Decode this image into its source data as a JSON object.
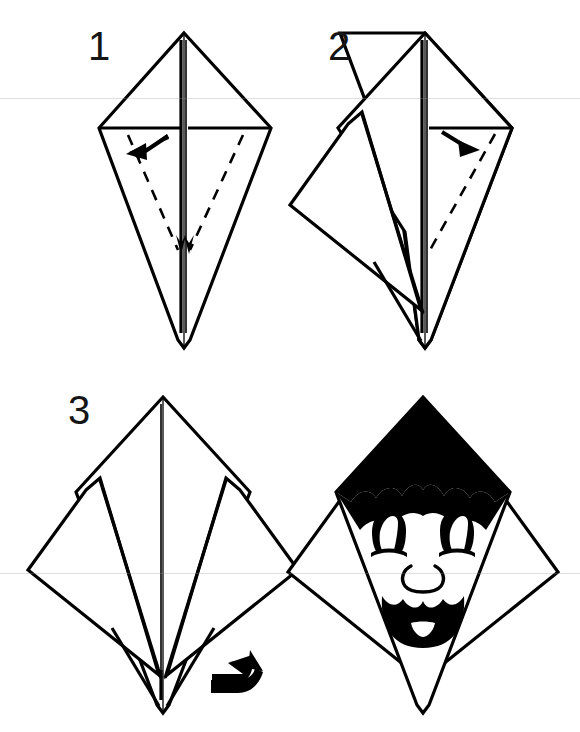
{
  "document": {
    "title": "Origami Folding Diagram",
    "kind": "instruction-sheet",
    "background_color": "#ffffff",
    "ink_color": "#000000",
    "width": 580,
    "height": 732,
    "panel_count": 4
  },
  "steps": [
    {
      "id": "step-1",
      "number": "1",
      "number_x": 88,
      "number_y": 26,
      "model": "kite-base",
      "description": "Kite base with two lower flaps; dashed valley-fold lines marked on both lower wings, arrow points inward-left",
      "fold_lines": 2,
      "fold_line_style": "dashed",
      "arrows": [
        {
          "name": "fold-arrow-left",
          "direction": "down-left"
        },
        {
          "name": "fold-arrow-center",
          "direction": "down"
        }
      ]
    },
    {
      "id": "step-2",
      "number": "2",
      "number_x": 328,
      "number_y": 26,
      "model": "kite-base-left-flap-out",
      "description": "Left flap swung outward to the left; dashed valley-fold line remains on right wing, arrow points inward-right",
      "fold_lines": 1,
      "fold_line_style": "dashed",
      "arrows": [
        {
          "name": "fold-arrow-right",
          "direction": "down-right"
        }
      ]
    },
    {
      "id": "step-3",
      "number": "3",
      "number_x": 68,
      "number_y": 390,
      "model": "kite-base-both-flaps-out",
      "description": "Both flaps swung outward symmetrically forming wings; turn-over arrow indicates flipping the model",
      "fold_lines": 0,
      "fold_line_style": "none",
      "arrows": [
        {
          "name": "turn-over-arrow",
          "direction": "up-right",
          "meaning": "turn the model over"
        }
      ]
    },
    {
      "id": "step-4",
      "number": "",
      "model": "finished-face",
      "description": "Finished model shown as a cartoon face with black scalloped hair, two eyes with highlights, a round nose and an open smiling mouth with a tooth",
      "fold_lines": 0,
      "fold_line_style": "none",
      "arrows": []
    }
  ],
  "face": {
    "name": "cartoon-face",
    "hair": {
      "name": "hair",
      "style": "scalloped",
      "color": "#000000",
      "scallops": 6
    },
    "eyes": {
      "count": 2,
      "shape": "dome",
      "color": "#000000",
      "highlight": "white-crescent"
    },
    "nose": {
      "shape": "circle-outline",
      "color": "#000000"
    },
    "mouth": {
      "shape": "open-smile",
      "color": "#000000",
      "tooth": true,
      "tooth_color": "#ffffff"
    }
  },
  "scan_artifacts": {
    "lines": [
      {
        "name": "scan-line-upper",
        "y": 98
      },
      {
        "name": "scan-line-lower",
        "y": 573
      }
    ]
  }
}
